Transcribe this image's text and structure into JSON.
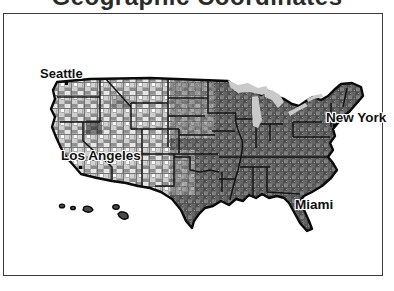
{
  "title": "Geographic Coordinates",
  "map": {
    "description": "USA county-level grayscale map",
    "cities": [
      {
        "name": "Seattle"
      },
      {
        "name": "Los Angeles"
      },
      {
        "name": "New York"
      },
      {
        "name": "Miami"
      }
    ]
  },
  "colors": {
    "lake": "#c9c9c9",
    "outline": "#0a0a0a",
    "state_line": "#151515",
    "hawaii_fill": "#4a4a4a",
    "label_text": "#111111",
    "frame_border": "#3a3a3a"
  }
}
